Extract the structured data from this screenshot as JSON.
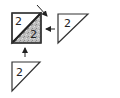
{
  "diagram": {
    "main_block": {
      "top_left_triangle_label": "2",
      "bottom_right_triangle_label": "2",
      "fill_light": "#ffffff",
      "fill_dark": "#b8b8b8"
    },
    "right_triangle": {
      "label": "2"
    },
    "bottom_triangle": {
      "label": "2"
    },
    "colors": {
      "stroke": "#333333",
      "arrow": "#222222"
    }
  }
}
